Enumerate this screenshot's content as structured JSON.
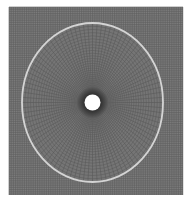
{
  "figure": {
    "type": "finite-element-mesh",
    "background": "#ffffff",
    "domain_rect": {
      "x": 9,
      "y": 7,
      "width": 174,
      "height": 188,
      "fill": "#7c7c7c",
      "grid_color": "#5e5e5e",
      "grid_spacing": 2.2
    },
    "center": {
      "x": 92.5,
      "y": 102.5
    },
    "outer_ring": {
      "rx": 70.5,
      "ry": 79.5,
      "stroke": "#d4d4d4",
      "width": 1.8
    },
    "dense_zone": {
      "r": 16,
      "fill": "#2e2e2e"
    },
    "hole": {
      "r": 8,
      "fill": "#ffffff"
    },
    "radial_lines": 96,
    "circumferential_rings": 34
  }
}
